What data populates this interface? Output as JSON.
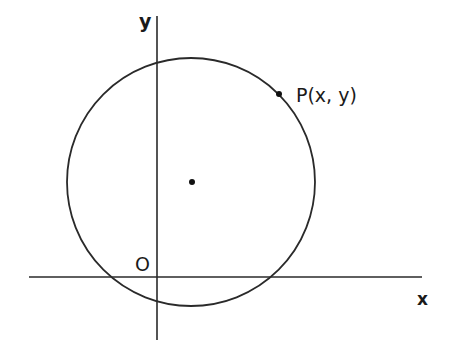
{
  "diagram": {
    "type": "coordinate-geometry",
    "colors": {
      "stroke": "#2a2a2a",
      "text": "#1a1a1a",
      "background": "#ffffff"
    },
    "axes": {
      "x_label": "x",
      "y_label": "y",
      "origin_label": "O",
      "x_axis": {
        "x1": 29,
        "x2": 422,
        "y": 277
      },
      "y_axis": {
        "x": 157,
        "y1": 16,
        "y2": 340
      }
    },
    "circle": {
      "cx": 191,
      "cy": 182,
      "r": 124
    },
    "center_point": {
      "x": 192,
      "y": 182
    },
    "point_p": {
      "x": 279,
      "y": 94,
      "label": "P(x, y)"
    }
  }
}
